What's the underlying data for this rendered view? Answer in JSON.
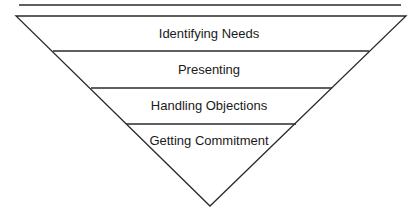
{
  "diagram": {
    "type": "inverted-funnel",
    "stages": [
      {
        "label": "Identifying Needs"
      },
      {
        "label": "Presenting"
      },
      {
        "label": "Handling Objections"
      },
      {
        "label": "Getting Commitment"
      }
    ],
    "colors": {
      "stroke": "#2a2a2a",
      "background": "#ffffff",
      "text": "#1a1a1a"
    }
  }
}
